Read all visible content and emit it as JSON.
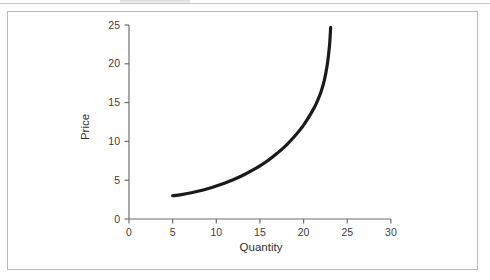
{
  "figure": {
    "border_color": "#b8b8b8",
    "background": "#ffffff"
  },
  "chart_data": {
    "type": "line",
    "title": "",
    "subtitle": "",
    "xlabel": "Quantity",
    "ylabel": "Price",
    "xlim": [
      0,
      30
    ],
    "ylim": [
      0,
      25
    ],
    "xticks": [
      0,
      5,
      10,
      15,
      20,
      25,
      30
    ],
    "yticks": [
      0,
      5,
      10,
      15,
      20,
      25
    ],
    "xtick_labels": [
      "0",
      "5",
      "10",
      "15",
      "20",
      "25",
      "30"
    ],
    "ytick_labels": [
      "0",
      "5",
      "10",
      "15",
      "20",
      "25"
    ],
    "grid": false,
    "legend": false,
    "legend_position": "none",
    "annotations": [],
    "series": [
      {
        "name": "Supply",
        "color": "#1a1a1a",
        "line_width": 3.2,
        "x": [
          5.0,
          6.0,
          7.0,
          8.0,
          9.0,
          10.0,
          11.0,
          12.0,
          13.0,
          14.0,
          15.0,
          16.0,
          17.0,
          18.0,
          19.0,
          20.0,
          21.0,
          21.5,
          22.0,
          22.4,
          22.7,
          22.9,
          23.0,
          23.1
        ],
        "y": [
          3.0,
          3.15,
          3.35,
          3.6,
          3.9,
          4.25,
          4.65,
          5.1,
          5.6,
          6.2,
          6.85,
          7.6,
          8.5,
          9.5,
          10.7,
          12.1,
          13.9,
          15.0,
          16.4,
          18.0,
          19.8,
          21.6,
          22.8,
          24.7
        ]
      }
    ]
  },
  "axis_geometry": {
    "x_pixel_zero": 121,
    "x_pixel_per_unit": 8.73,
    "y_pixel_zero": 207,
    "y_pixel_per_unit": 7.76
  }
}
